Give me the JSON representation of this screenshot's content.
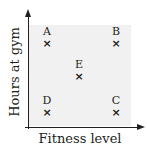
{
  "chart_data": {
    "type": "scatter",
    "title": "",
    "xlabel": "Fitness level",
    "ylabel": "Hours at gym",
    "x_ticks": [],
    "y_ticks": [],
    "grid": false,
    "legend": null,
    "marker": "x",
    "xlim": [
      0,
      10
    ],
    "ylim": [
      0,
      10
    ],
    "points": [
      {
        "label": "A",
        "x": 1.7,
        "y": 8.3,
        "px": 47,
        "py": 43
      },
      {
        "label": "B",
        "x": 8.5,
        "y": 8.3,
        "px": 116,
        "py": 43
      },
      {
        "label": "C",
        "x": 8.5,
        "y": 1.5,
        "px": 116,
        "py": 112
      },
      {
        "label": "D",
        "x": 1.7,
        "y": 1.5,
        "px": 47,
        "py": 112
      },
      {
        "label": "E",
        "x": 5.0,
        "y": 5.0,
        "px": 79,
        "py": 76
      }
    ],
    "colors": {
      "axis": "#231f20",
      "plot_background": "#f1f1f1",
      "marker": "#231f20"
    }
  },
  "axes": {
    "x_label": "Fitness level",
    "y_label": "Hours at gym"
  },
  "marker_glyph": "×"
}
